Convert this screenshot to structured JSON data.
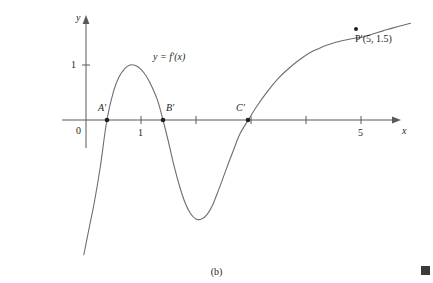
{
  "figure": {
    "caption": "(b)",
    "curve_label": "y = f′(x)",
    "end_marker": "section-end-square"
  },
  "axes": {
    "x_axis_name": "x",
    "y_axis_name": "y",
    "origin_label": "0",
    "x_tick_labels": [
      "1",
      "5"
    ],
    "y_tick_labels": [
      "1"
    ],
    "axis_color": "#58595b"
  },
  "points": [
    {
      "name": "A′",
      "label": "A′",
      "x": 0.38,
      "y": 0
    },
    {
      "name": "B′",
      "label": "B′",
      "x": 1.4,
      "y": 0
    },
    {
      "name": "C′",
      "label": "C′",
      "x": 2.95,
      "y": 0
    },
    {
      "name": "P′",
      "label": "P′(5, 1.5)",
      "x": 5.0,
      "y": 1.5
    }
  ],
  "chart_data": {
    "type": "line",
    "title": "",
    "subtitle": "",
    "xlabel": "x",
    "ylabel": "y",
    "xlim": [
      -0.04,
      5.9
    ],
    "ylim": [
      -2.45,
      2.1
    ],
    "grid": false,
    "legend": null,
    "annotations": [
      {
        "text": "y = f′(x)",
        "x": 1.28,
        "y": 1.1
      },
      {
        "text": "A′",
        "x": 0.33,
        "y": 0.22
      },
      {
        "text": "B′",
        "x": 1.45,
        "y": 0.22
      },
      {
        "text": "C′",
        "x": 2.88,
        "y": 0.22
      },
      {
        "text": "P′(5, 1.5)",
        "x": 5.05,
        "y": 1.32
      }
    ],
    "x_ticks": [
      1,
      2,
      3,
      4,
      5
    ],
    "x_ticks_labeled": [
      1,
      5
    ],
    "y_ticks": [
      1
    ],
    "series": [
      {
        "name": "y = f'(x)",
        "x": [
          -0.04,
          0.06,
          0.16,
          0.26,
          0.38,
          0.5,
          0.6,
          0.7,
          0.8,
          0.9,
          1.0,
          1.1,
          1.2,
          1.3,
          1.4,
          1.5,
          1.6,
          1.7,
          1.8,
          1.9,
          2.0,
          2.1,
          2.2,
          2.3,
          2.4,
          2.5,
          2.6,
          2.7,
          2.8,
          2.95,
          3.1,
          3.3,
          3.5,
          3.7,
          3.9,
          4.1,
          4.3,
          4.5,
          4.7,
          4.9,
          5.0,
          5.2,
          5.4,
          5.6,
          5.9
        ],
        "y": [
          -2.45,
          -1.95,
          -1.45,
          -0.85,
          0.0,
          0.52,
          0.78,
          0.93,
          1.0,
          0.99,
          0.92,
          0.79,
          0.6,
          0.36,
          0.0,
          -0.4,
          -0.83,
          -1.2,
          -1.5,
          -1.7,
          -1.8,
          -1.8,
          -1.72,
          -1.55,
          -1.3,
          -1.03,
          -0.76,
          -0.5,
          -0.25,
          0.0,
          0.24,
          0.52,
          0.76,
          0.95,
          1.11,
          1.24,
          1.33,
          1.4,
          1.45,
          1.49,
          1.5,
          1.56,
          1.62,
          1.68,
          1.76
        ]
      }
    ]
  }
}
